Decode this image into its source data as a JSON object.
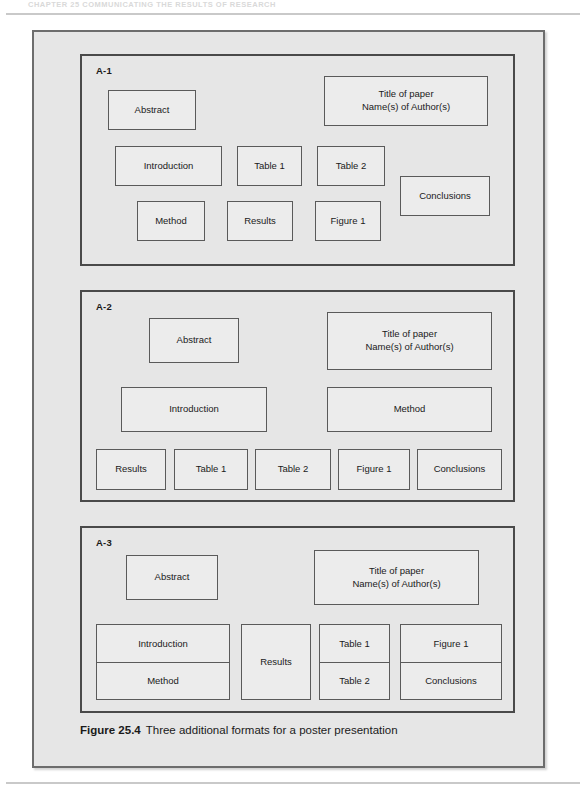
{
  "page": {
    "running_head": "CHAPTER 25  COMMUNICATING THE RESULTS OF RESEARCH",
    "caption_number": "Figure 25.4",
    "caption_text": "Three additional formats for a poster presentation"
  },
  "panels": [
    {
      "label": "A-1",
      "boxes": [
        {
          "name": "abstract",
          "text": "Abstract"
        },
        {
          "name": "title",
          "line1": "Title of paper",
          "line2": "Name(s) of Author(s)"
        },
        {
          "name": "introduction",
          "text": "Introduction"
        },
        {
          "name": "table-1",
          "text": "Table 1"
        },
        {
          "name": "table-2",
          "text": "Table 2"
        },
        {
          "name": "conclusions",
          "text": "Conclusions"
        },
        {
          "name": "method",
          "text": "Method"
        },
        {
          "name": "results",
          "text": "Results"
        },
        {
          "name": "figure-1",
          "text": "Figure 1"
        }
      ]
    },
    {
      "label": "A-2",
      "boxes": [
        {
          "name": "abstract",
          "text": "Abstract"
        },
        {
          "name": "title",
          "line1": "Title of paper",
          "line2": "Name(s) of Author(s)"
        },
        {
          "name": "introduction",
          "text": "Introduction"
        },
        {
          "name": "method",
          "text": "Method"
        },
        {
          "name": "results",
          "text": "Results"
        },
        {
          "name": "table-1",
          "text": "Table 1"
        },
        {
          "name": "table-2",
          "text": "Table 2"
        },
        {
          "name": "figure-1",
          "text": "Figure 1"
        },
        {
          "name": "conclusions",
          "text": "Conclusions"
        }
      ]
    },
    {
      "label": "A-3",
      "boxes": [
        {
          "name": "abstract",
          "text": "Abstract"
        },
        {
          "name": "title",
          "line1": "Title of paper",
          "line2": "Name(s) of Author(s)"
        },
        {
          "name": "introduction",
          "text": "Introduction"
        },
        {
          "name": "method",
          "text": "Method"
        },
        {
          "name": "results",
          "text": "Results"
        },
        {
          "name": "table-1",
          "text": "Table 1"
        },
        {
          "name": "table-2",
          "text": "Table 2"
        },
        {
          "name": "figure-1",
          "text": "Figure 1"
        },
        {
          "name": "conclusions",
          "text": "Conclusions"
        }
      ]
    }
  ],
  "colors": {
    "page_background": "#ffffff",
    "figure_background": "#e6e6e6",
    "box_background": "#ececec",
    "frame_border": "#6d6d6d",
    "panel_border": "#4a4a4a",
    "box_border": "#5a5a5a",
    "text": "#1a1a1a",
    "rule": "#c9c9c9"
  }
}
